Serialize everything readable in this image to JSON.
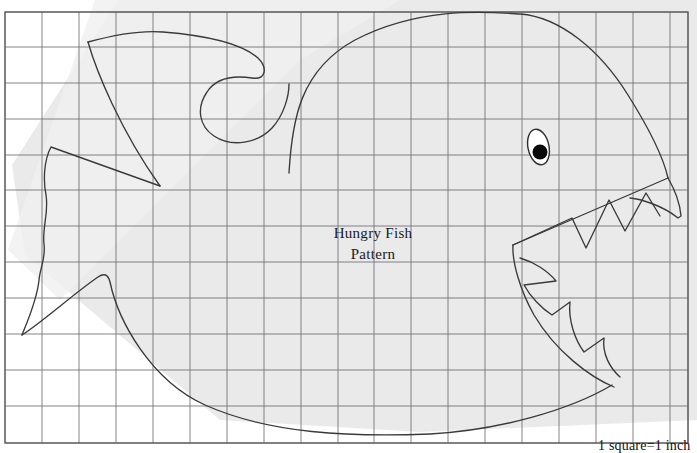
{
  "document": {
    "kind": "craft-pattern-worksheet",
    "background_color": "#ffffff"
  },
  "pattern": {
    "title_line1": "Hungry Fish",
    "title_line2": "Pattern",
    "title_x": 373,
    "title_y1": 238,
    "title_y2": 259,
    "outline_color": "#3a3a3a",
    "subject": "fish"
  },
  "scale_note": {
    "text": "1 square=1 inch",
    "x": 598,
    "y": 450
  },
  "grid": {
    "line_color": "#6f6f74",
    "border_color": "#55555a",
    "left": 5,
    "top": 12,
    "right": 688,
    "bottom": 443,
    "cell_size_px": 36.9,
    "columns": 18,
    "rows": 12,
    "vertical_lines": [
      5,
      42,
      79,
      116,
      153,
      190,
      227,
      264,
      301,
      338,
      374,
      411,
      448,
      485,
      522,
      559,
      596,
      633,
      670,
      688
    ],
    "horizontal_lines": [
      12,
      47,
      83,
      119,
      155,
      190,
      226,
      262,
      298,
      334,
      370,
      406,
      443
    ],
    "square_equals": "1 inch"
  },
  "shadow": {
    "color": "#e9e9e9",
    "description": "scanner shadow polygon behind pattern",
    "points": "118,0 697,0 697,420 420,432 220,420 25,255 12,165"
  },
  "fish": {
    "body_path": "M 289,173 C 292,120 300,70 355,40 C 420,6 487,12 520,14 C 560,17 600,50 628,95 C 650,130 664,160 668,178",
    "dorsal_fin_path": "M 88,42 C 110,36 140,30 163,32 C 200,35 240,42 258,58 C 268,68 266,80 252,78 C 232,75 216,78 207,92 C 196,108 199,126 214,136 C 232,148 258,143 272,128 C 284,115 289,96 289,84",
    "fin_back_edge": "M 88,42 C 96,70 120,130 160,186",
    "tail_path": "M 51,147 L 160,186 L 51,147 C 44,160 43,180 46,195 C 49,212 42,228 44,244 C 46,258 40,268 39,280 C 37,300 28,320 22,335",
    "belly_path": "M 22,335 C 45,320 72,295 98,277 C 104,273 108,274 110,282 C 118,320 150,380 205,405 C 270,434 350,437 430,434 C 500,430 570,410 612,385",
    "eye_outline": {
      "cx": 538.5,
      "cy": 147,
      "rx": 10.5,
      "ry": 18,
      "rotate": -12
    },
    "eye_pupil": {
      "cx": 540,
      "cy": 152,
      "r": 7.5
    },
    "upper_jaw_path": "M 668,178 C 675,190 680,204 681,216 L 678,218 C 662,205 640,199 630,198",
    "upper_teeth_path": "M 513,245 L 572,218 L 586,248 L 609,200 L 625,231 L 646,193 L 660,216",
    "jaw_line_path": "M 513,245 L 668,178",
    "lower_jaw_outer": "M 513,245 C 512,262 520,290 534,315 C 556,352 590,377 614,387",
    "lower_teeth_path": "M 520,258 C 534,262 548,271 556,281 L 524,285 C 530,296 541,308 552,315 L 570,302 C 568,320 575,340 584,352 L 604,338 C 602,354 610,368 620,377",
    "mouth_inner_path": "M 513,245 C 521,250 530,254 540,256"
  },
  "icons": {
    "fish_eye": "eye-icon"
  }
}
